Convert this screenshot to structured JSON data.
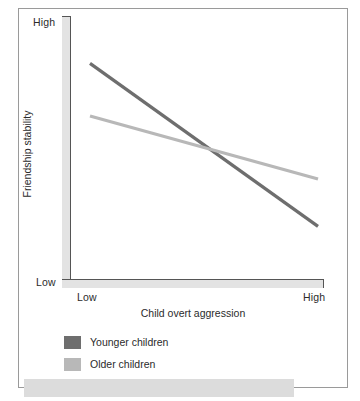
{
  "figure": {
    "frame_color": "#9a9a9a",
    "background": "#ffffff",
    "axis_band_color": "#e3e3e3",
    "axis_line_color": "#555555"
  },
  "axes": {
    "y_title": "Friendship stability",
    "x_title": "Child overt aggression",
    "y_ticks": [
      "High",
      "Low"
    ],
    "x_ticks": [
      "Low",
      "High"
    ]
  },
  "legend": {
    "items": [
      {
        "label": "Younger children",
        "color": "#6e6e6e"
      },
      {
        "label": "Older children",
        "color": "#b8b8b8"
      }
    ]
  },
  "chart_data": {
    "type": "line",
    "title": "",
    "subtitle": "",
    "xlabel": "Child overt aggression",
    "ylabel": "Friendship stability",
    "x": [
      "Low",
      "High"
    ],
    "xlim": [
      "Low",
      "High"
    ],
    "ylim": [
      "Low",
      "High"
    ],
    "grid": false,
    "legend_position": "below-plot-left",
    "axis_style": "L-shaped gray band with dark inner rule and end ticks",
    "series": [
      {
        "name": "Younger children",
        "color": "#6e6e6e",
        "line_width": 3,
        "values": [
          0.82,
          0.2
        ],
        "description": "Steep decline: friendship stability drops sharply as child overt aggression increases"
      },
      {
        "name": "Older children",
        "color": "#b8b8b8",
        "line_width": 3,
        "values": [
          0.62,
          0.38
        ],
        "description": "Shallow decline: friendship stability decreases only modestly as child overt aggression increases"
      }
    ],
    "annotations": [
      {
        "type": "intersection",
        "text": "The two series cross slightly past the midpoint of the x-axis",
        "x": 0.58,
        "y": 0.48
      }
    ]
  }
}
